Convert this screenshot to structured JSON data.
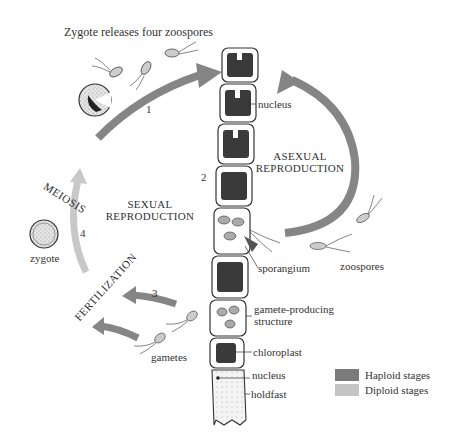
{
  "diagram": {
    "title": "Zygote releases four zoospores",
    "cycles": {
      "sexual": {
        "line1": "SEXUAL",
        "line2": "REPRODUCTION"
      },
      "asexual": {
        "line1": "ASEXUAL",
        "line2": "REPRODUCTION"
      }
    },
    "stages": {
      "meiosis": "MEIOSIS",
      "fertilization": "FERTILIZATION"
    },
    "steps": [
      "1",
      "2",
      "3",
      "4"
    ],
    "labels": {
      "nucleus_top": "nucleus",
      "sporangium": "sporangium",
      "zoospores": "zoospores",
      "gamete_structure_line1": "gamete-producing",
      "gamete_structure_line2": "structure",
      "chloroplast": "chloroplast",
      "nucleus_bottom": "nucleus",
      "holdfast": "holdfast",
      "zygote": "zygote",
      "gametes": "gametes"
    },
    "legend": [
      {
        "label": "Haploid stages",
        "color": "#7a7a7a"
      },
      {
        "label": "Diploid stages",
        "color": "#c4c4c4"
      }
    ],
    "colors": {
      "haploid_arrow": "#858585",
      "diploid_arrow": "#c8c8c8",
      "cell_dark": "#3a3a3a",
      "outline": "#333333"
    }
  }
}
